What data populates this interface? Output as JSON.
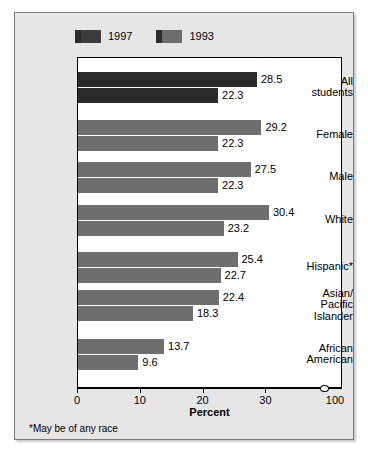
{
  "legend": {
    "entries": [
      {
        "label": "1997",
        "color": "#3c3c3c"
      },
      {
        "label": "1993",
        "color": "#6e6e6e"
      }
    ]
  },
  "axis": {
    "title": "Percent",
    "ticks": [
      {
        "value": 0,
        "label": "0"
      },
      {
        "value": 10,
        "label": "10"
      },
      {
        "value": 20,
        "label": "20"
      },
      {
        "value": 30,
        "label": "30"
      },
      {
        "value": 100,
        "label": "100"
      }
    ],
    "break_symbol": "axis-break"
  },
  "footnote": "*May be of any race",
  "chart_data": {
    "type": "bar",
    "orientation": "horizontal",
    "title": "",
    "xlabel": "Percent",
    "ylabel": "",
    "xlim": [
      0,
      100
    ],
    "xticks": [
      0,
      10,
      20,
      30,
      100
    ],
    "axis_break_after": 30,
    "grid": false,
    "legend_position": "top-left",
    "categories": [
      "All students",
      "Female",
      "Male",
      "White",
      "Hispanic*",
      "Asian/ Pacific Islander",
      "African American"
    ],
    "series": [
      {
        "name": "1997",
        "color": "#6e6e6e",
        "values": [
          28.5,
          29.2,
          27.5,
          30.4,
          25.4,
          22.4,
          13.7
        ]
      },
      {
        "name": "1993",
        "color": "#6e6e6e",
        "values": [
          22.3,
          22.3,
          22.3,
          23.2,
          22.7,
          18.3,
          9.6
        ]
      }
    ],
    "highlighted_category": "All students",
    "highlight_color": "#2b2b2b"
  },
  "rows": [
    {
      "label_lines": [
        "All",
        "students"
      ],
      "highlighted": true,
      "bars": [
        {
          "series": "1997",
          "value": 28.5,
          "value_label": "28.5"
        },
        {
          "series": "1993",
          "value": 22.3,
          "value_label": "22.3"
        }
      ]
    },
    {
      "label_lines": [
        "Female"
      ],
      "highlighted": false,
      "bars": [
        {
          "series": "1997",
          "value": 29.2,
          "value_label": "29.2"
        },
        {
          "series": "1993",
          "value": 22.3,
          "value_label": "22.3"
        }
      ]
    },
    {
      "label_lines": [
        "Male"
      ],
      "highlighted": false,
      "bars": [
        {
          "series": "1997",
          "value": 27.5,
          "value_label": "27.5"
        },
        {
          "series": "1993",
          "value": 22.3,
          "value_label": "22.3"
        }
      ]
    },
    {
      "label_lines": [
        "White"
      ],
      "highlighted": false,
      "bars": [
        {
          "series": "1997",
          "value": 30.4,
          "value_label": "30.4"
        },
        {
          "series": "1993",
          "value": 23.2,
          "value_label": "23.2"
        }
      ]
    },
    {
      "label_lines": [
        "Hispanic*"
      ],
      "highlighted": false,
      "bars": [
        {
          "series": "1997",
          "value": 25.4,
          "value_label": "25.4"
        },
        {
          "series": "1993",
          "value": 22.7,
          "value_label": "22.7"
        }
      ]
    },
    {
      "label_lines": [
        "Asian/",
        "Pacific",
        "Islander"
      ],
      "highlighted": false,
      "bars": [
        {
          "series": "1997",
          "value": 22.4,
          "value_label": "22.4"
        },
        {
          "series": "1993",
          "value": 18.3,
          "value_label": "18.3"
        }
      ]
    },
    {
      "label_lines": [
        "African",
        "American"
      ],
      "highlighted": false,
      "bars": [
        {
          "series": "1997",
          "value": 13.7,
          "value_label": "13.7"
        },
        {
          "series": "1993",
          "value": 9.6,
          "value_label": "9.6"
        }
      ]
    }
  ]
}
